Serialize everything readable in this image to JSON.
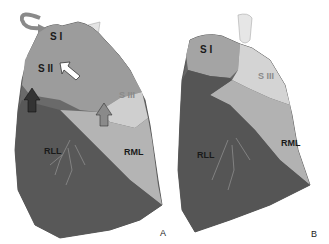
{
  "figure": {
    "panels": [
      {
        "id": "A",
        "panel_label": "A",
        "labels": {
          "s1": "S I",
          "s2": "S II",
          "s3": "S III",
          "rll": "RLL",
          "rml": "RML"
        },
        "arrows": [
          {
            "type": "curved-arrow",
            "color": "gray",
            "location": "upper-left near S I"
          },
          {
            "type": "white-arrow",
            "direction": "up-left",
            "location": "pointing at S II"
          },
          {
            "type": "dark-arrow",
            "direction": "up",
            "location": "left mid"
          },
          {
            "type": "gray-arrow",
            "direction": "up",
            "location": "below S III"
          }
        ]
      },
      {
        "id": "B",
        "panel_label": "B",
        "labels": {
          "s1": "S I",
          "s3": "S III",
          "rll": "RLL",
          "rml": "RML"
        }
      }
    ],
    "colors": {
      "upper_lobe": "#9a9a9a",
      "s3_light": "#d0d0d0",
      "rml": "#b5b5b5",
      "rll": "#5a5a5a",
      "trachea": "#e0e0e0"
    }
  }
}
